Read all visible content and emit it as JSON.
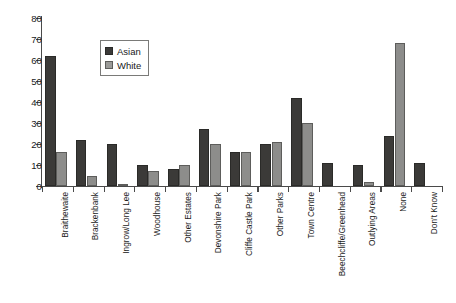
{
  "chart_data": {
    "type": "bar",
    "title": "",
    "subtitle": "",
    "xlabel": "",
    "ylabel": "",
    "ylim": [
      0,
      80
    ],
    "ytick_step": 10,
    "yticks": [
      "0",
      "10",
      "20",
      "30",
      "40",
      "50",
      "60",
      "70",
      "80"
    ],
    "grid": false,
    "legend_position": "upper-left-inset",
    "categories": [
      "Braithewaite",
      "Brackenbank",
      "Ingrow/Long Lee",
      "Woodhouse",
      "Other Estates",
      "Devonshire Park",
      "Cliffe Castle Park",
      "Other Parks",
      "Town Centre",
      "Beechcliffe/Greenhead",
      "Outlying Areas",
      "None",
      "Don't Know"
    ],
    "series": [
      {
        "name": "Asian",
        "color": "#3b3a38",
        "values": [
          62,
          22,
          20,
          10,
          8,
          27,
          16,
          20,
          42,
          11,
          10,
          24,
          11
        ]
      },
      {
        "name": "White",
        "color": "#8d8d8b",
        "values": [
          16,
          5,
          1,
          7,
          10,
          20,
          16,
          21,
          30,
          0,
          2,
          68,
          0
        ]
      }
    ]
  },
  "legend": {
    "items": [
      {
        "label": "Asian",
        "swatch": "asian"
      },
      {
        "label": "White",
        "swatch": "white"
      }
    ]
  }
}
